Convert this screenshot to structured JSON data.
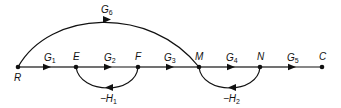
{
  "diagram": {
    "type": "signal-flow-graph",
    "nodes": [
      {
        "id": "R",
        "label": "R"
      },
      {
        "id": "E",
        "label": "E"
      },
      {
        "id": "F",
        "label": "F"
      },
      {
        "id": "M",
        "label": "M"
      },
      {
        "id": "N",
        "label": "N"
      },
      {
        "id": "C",
        "label": "C"
      }
    ],
    "branches": [
      {
        "from": "R",
        "to": "E",
        "gain": "G",
        "sub": "1"
      },
      {
        "from": "E",
        "to": "F",
        "gain": "G",
        "sub": "2"
      },
      {
        "from": "F",
        "to": "M",
        "gain": "G",
        "sub": "3"
      },
      {
        "from": "M",
        "to": "N",
        "gain": "G",
        "sub": "4"
      },
      {
        "from": "N",
        "to": "C",
        "gain": "G",
        "sub": "5"
      },
      {
        "from": "R",
        "to": "M",
        "gain": "G",
        "sub": "6"
      },
      {
        "from": "F",
        "to": "E",
        "gain": "−H",
        "sub": "1"
      },
      {
        "from": "N",
        "to": "M",
        "gain": "−H",
        "sub": "2"
      }
    ]
  }
}
